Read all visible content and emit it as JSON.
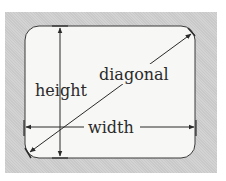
{
  "diagram": {
    "labels": {
      "height": "height",
      "diagonal": "diagonal",
      "width": "width"
    },
    "colors": {
      "frame": "#c9c9c9",
      "screen": "#f7f7f5",
      "ink": "#2a2a2a"
    }
  }
}
